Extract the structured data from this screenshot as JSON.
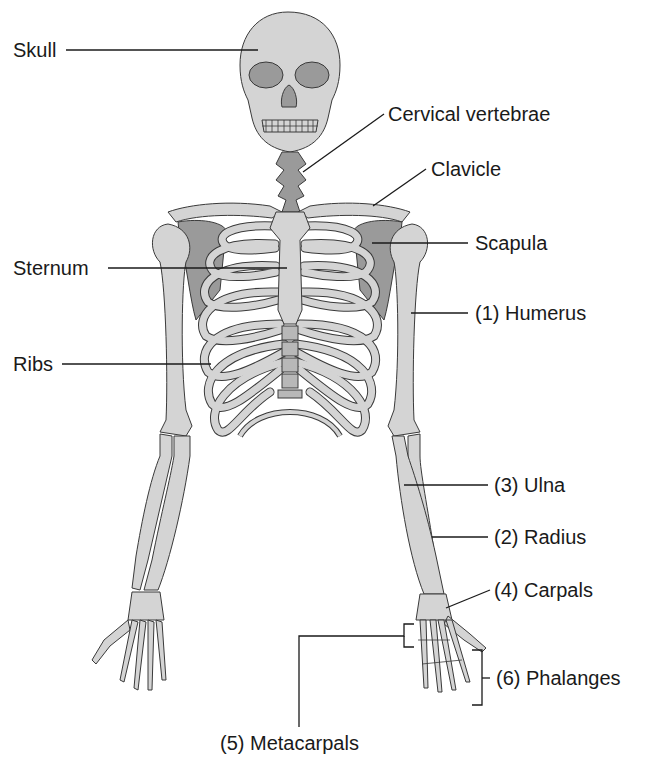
{
  "diagram": {
    "colors": {
      "bone_fill": "#d4d4d4",
      "bone_dark_fill": "#9a9a9a",
      "outline": "#3a3a3a",
      "text": "#1a1a1a",
      "background": "#ffffff"
    },
    "labels": {
      "skull": "Skull",
      "cervical_vertebrae": "Cervical vertebrae",
      "clavicle": "Clavicle",
      "scapula": "Scapula",
      "sternum": "Sternum",
      "humerus": "(1) Humerus",
      "ribs": "Ribs",
      "ulna": "(3) Ulna",
      "radius": "(2) Radius",
      "carpals": "(4) Carpals",
      "phalanges": "(6) Phalanges",
      "metacarpals": "(5) Metacarpals"
    }
  }
}
